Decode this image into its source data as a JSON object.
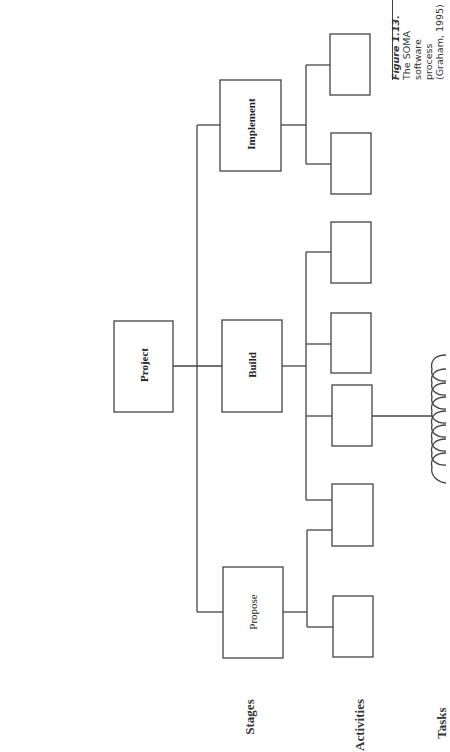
{
  "caption": {
    "title": "Figure 1.13.",
    "lines": [
      "The SOMA",
      "software process",
      "(Graham, 1995)"
    ]
  },
  "diagram": {
    "root": {
      "label": "Project"
    },
    "stages": [
      {
        "label": "Implement",
        "activity_count": 2
      },
      {
        "label": "Build",
        "activity_count": 4
      },
      {
        "label": "Propose",
        "activity_count": 2
      }
    ],
    "task_count": 5,
    "stroke_color": "#444444"
  },
  "row_labels": {
    "stages": "Stages",
    "activities": "Activities",
    "tasks": "Tasks"
  }
}
